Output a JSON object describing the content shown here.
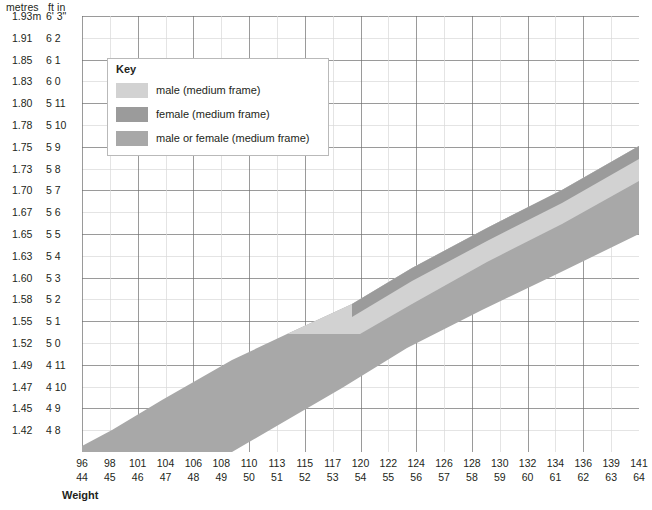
{
  "axis_header": {
    "metres": "metres",
    "ft_in": "ft in"
  },
  "y_axis": {
    "ticks": [
      {
        "metres": "1.93m",
        "ft_in": "6' 3\""
      },
      {
        "metres": "1.91",
        "ft_in": "6 2"
      },
      {
        "metres": "1.85",
        "ft_in": "6 1"
      },
      {
        "metres": "1.83",
        "ft_in": "6 0"
      },
      {
        "metres": "1.80",
        "ft_in": "5 11"
      },
      {
        "metres": "1.78",
        "ft_in": "5 10"
      },
      {
        "metres": "1.75",
        "ft_in": "5 9"
      },
      {
        "metres": "1.73",
        "ft_in": "5 8"
      },
      {
        "metres": "1.70",
        "ft_in": "5 7"
      },
      {
        "metres": "1.67",
        "ft_in": "5 6"
      },
      {
        "metres": "1.65",
        "ft_in": "5 5"
      },
      {
        "metres": "1.63",
        "ft_in": "5 4"
      },
      {
        "metres": "1.60",
        "ft_in": "5 3"
      },
      {
        "metres": "1.58",
        "ft_in": "5 2"
      },
      {
        "metres": "1.55",
        "ft_in": "5 1"
      },
      {
        "metres": "1.52",
        "ft_in": "5 0"
      },
      {
        "metres": "1.49",
        "ft_in": "4 11"
      },
      {
        "metres": "1.47",
        "ft_in": "4 10"
      },
      {
        "metres": "1.45",
        "ft_in": "4 9"
      },
      {
        "metres": "1.42",
        "ft_in": "4 8"
      }
    ]
  },
  "x_axis": {
    "title": "Weight",
    "ticks": [
      {
        "lb": "96",
        "kg": "44"
      },
      {
        "lb": "98",
        "kg": "45"
      },
      {
        "lb": "101",
        "kg": "46"
      },
      {
        "lb": "104",
        "kg": "47"
      },
      {
        "lb": "106",
        "kg": "48"
      },
      {
        "lb": "108",
        "kg": "49"
      },
      {
        "lb": "110",
        "kg": "50"
      },
      {
        "lb": "113",
        "kg": "51"
      },
      {
        "lb": "115",
        "kg": "52"
      },
      {
        "lb": "117",
        "kg": "53"
      },
      {
        "lb": "120",
        "kg": "54"
      },
      {
        "lb": "122",
        "kg": "55"
      },
      {
        "lb": "124",
        "kg": "56"
      },
      {
        "lb": "126",
        "kg": "57"
      },
      {
        "lb": "128",
        "kg": "58"
      },
      {
        "lb": "130",
        "kg": "59"
      },
      {
        "lb": "132",
        "kg": "60"
      },
      {
        "lb": "134",
        "kg": "61"
      },
      {
        "lb": "136",
        "kg": "62"
      },
      {
        "lb": "139",
        "kg": "63"
      },
      {
        "lb": "141",
        "kg": "64"
      }
    ]
  },
  "legend": {
    "title": "Key",
    "items": [
      {
        "label": "male (medium frame)",
        "color": "#d2d2d2"
      },
      {
        "label": "female (medium frame)",
        "color": "#9b9b9b"
      },
      {
        "label": "male or female (medium frame)",
        "color": "#a8a8a8"
      }
    ]
  },
  "colors": {
    "grid_major": "#6f6f6f",
    "grid_minor": "#d9d9d9",
    "male": "#d2d2d2",
    "female": "#9b9b9b",
    "both": "#a8a8a8",
    "text": "#231f20"
  },
  "chart_data": {
    "type": "area",
    "xlabel": "Weight",
    "ylabel": "",
    "grid": true,
    "legend_position": "inside-top-left",
    "x_unit_primary": "lb",
    "x_unit_secondary": "kg",
    "y_unit_primary": "metres",
    "y_unit_secondary": "ft in",
    "xlim_lb": [
      96,
      141
    ],
    "xlim_kg": [
      44,
      64
    ],
    "ylim_m": [
      1.42,
      1.93
    ],
    "series": [
      {
        "name": "male or female (medium frame)",
        "color": "#a8a8a8",
        "note": "Broad diagonal band spanning the full weight range.",
        "upper_boundary": [
          {
            "lb": 96,
            "m": 1.425
          },
          {
            "lb": 101,
            "m": 1.5
          },
          {
            "lb": 108,
            "m": 1.555
          },
          {
            "lb": 113,
            "m": 1.585
          },
          {
            "lb": 117,
            "m": 1.615
          },
          {
            "lb": 122,
            "m": 1.655
          },
          {
            "lb": 128,
            "m": 1.685
          },
          {
            "lb": 134,
            "m": 1.715
          },
          {
            "lb": 141,
            "m": 1.755
          }
        ],
        "lower_boundary": [
          {
            "lb": 96,
            "m": 1.42
          },
          {
            "lb": 108,
            "m": 1.42
          },
          {
            "lb": 113,
            "m": 1.47
          },
          {
            "lb": 117,
            "m": 1.505
          },
          {
            "lb": 122,
            "m": 1.545
          },
          {
            "lb": 128,
            "m": 1.575
          },
          {
            "lb": 134,
            "m": 1.605
          },
          {
            "lb": 141,
            "m": 1.645
          }
        ]
      },
      {
        "name": "female (medium frame)",
        "color": "#9b9b9b",
        "note": "Darker sliver along the upper edge of the band, right half of the chart.",
        "upper_boundary": [
          {
            "lb": 120,
            "m": 1.655
          },
          {
            "lb": 130,
            "m": 1.705
          },
          {
            "lb": 141,
            "m": 1.755
          }
        ],
        "lower_boundary": [
          {
            "lb": 120,
            "m": 1.64
          },
          {
            "lb": 130,
            "m": 1.69
          },
          {
            "lb": 141,
            "m": 1.74
          }
        ]
      },
      {
        "name": "male (medium frame)",
        "color": "#d2d2d2",
        "note": "Light wedge below the main band on the right-hand side.",
        "upper_boundary": [
          {
            "lb": 117,
            "m": 1.505
          },
          {
            "lb": 122,
            "m": 1.545
          },
          {
            "lb": 128,
            "m": 1.575
          },
          {
            "lb": 134,
            "m": 1.605
          },
          {
            "lb": 141,
            "m": 1.645
          }
        ],
        "lower_boundary": [
          {
            "lb": 117,
            "m": 1.505
          },
          {
            "lb": 124,
            "m": 1.505
          },
          {
            "lb": 128,
            "m": 1.53
          },
          {
            "lb": 134,
            "m": 1.565
          },
          {
            "lb": 141,
            "m": 1.605
          }
        ]
      }
    ]
  }
}
